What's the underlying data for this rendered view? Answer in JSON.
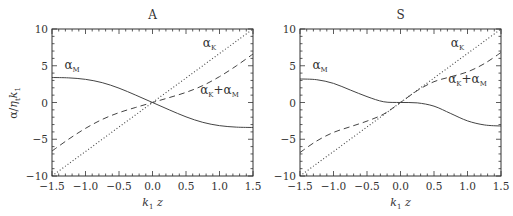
{
  "figure": {
    "ylabel": "α / η_t k_1",
    "xlabel": "k_1 z"
  },
  "chart_data": [
    {
      "type": "line",
      "title": "A",
      "xlabel": "k₁ z",
      "ylabel": "α/η_t k₁",
      "xlim": [
        -1.5,
        1.5
      ],
      "ylim": [
        -10,
        10
      ],
      "xticks": [
        -1.5,
        -1.0,
        -0.5,
        0.0,
        0.5,
        1.0,
        1.5
      ],
      "xtick_labels": [
        "−1.5",
        "−1.0",
        "−0.5",
        "0.0",
        "0.5",
        "1.0",
        "1.5"
      ],
      "yticks": [
        -10,
        -5,
        0,
        5,
        10
      ],
      "ytick_labels": [
        "−10",
        "−5",
        "0",
        "5",
        "10"
      ],
      "grid": false,
      "x": [
        -1.5,
        -1.25,
        -1.0,
        -0.75,
        -0.5,
        -0.25,
        0.0,
        0.25,
        0.5,
        0.75,
        1.0,
        1.25,
        1.5
      ],
      "series": [
        {
          "name": "α_K",
          "style": "dotted",
          "values": [
            -10.0,
            -8.33,
            -6.67,
            -5.0,
            -3.33,
            -1.67,
            0.0,
            1.67,
            3.33,
            5.0,
            6.67,
            8.33,
            10.0
          ]
        },
        {
          "name": "α_M",
          "style": "solid",
          "values": [
            3.4,
            3.35,
            3.15,
            2.7,
            1.95,
            1.0,
            0.0,
            -1.0,
            -1.95,
            -2.7,
            -3.15,
            -3.35,
            -3.4
          ]
        },
        {
          "name": "α_K+α_M",
          "style": "dashed",
          "values": [
            -6.6,
            -4.98,
            -3.52,
            -2.3,
            -1.38,
            -0.67,
            0.0,
            0.67,
            1.38,
            2.3,
            3.52,
            4.98,
            6.6
          ]
        }
      ],
      "annotations": [
        {
          "text": "α_K",
          "x": 0.85,
          "y": 7.6
        },
        {
          "text": "α_M",
          "x": -1.2,
          "y": 4.6
        },
        {
          "text": "α_K+α_M",
          "x": 1.0,
          "y": 1.2
        }
      ]
    },
    {
      "type": "line",
      "title": "S",
      "xlabel": "k₁ z",
      "ylabel": "",
      "xlim": [
        -1.5,
        1.5
      ],
      "ylim": [
        -10,
        10
      ],
      "xticks": [
        -1.5,
        -1.0,
        -0.5,
        0.0,
        0.5,
        1.0,
        1.5
      ],
      "xtick_labels": [
        "−1.5",
        "−1.0",
        "−0.5",
        "0.0",
        "0.5",
        "1.0",
        "1.5"
      ],
      "yticks": [
        -10,
        -5,
        0,
        5,
        10
      ],
      "ytick_labels": [
        "−10",
        "−5",
        "0",
        "5",
        "10"
      ],
      "grid": false,
      "x": [
        -1.5,
        -1.25,
        -1.0,
        -0.75,
        -0.5,
        -0.25,
        0.0,
        0.25,
        0.5,
        0.75,
        1.0,
        1.25,
        1.5
      ],
      "series": [
        {
          "name": "α_K",
          "style": "dotted",
          "values": [
            -10.0,
            -8.33,
            -6.67,
            -5.0,
            -3.33,
            -1.67,
            0.0,
            1.67,
            3.33,
            5.0,
            6.67,
            8.33,
            10.0
          ]
        },
        {
          "name": "α_M",
          "style": "solid",
          "values": [
            3.2,
            3.1,
            2.6,
            1.7,
            0.8,
            0.1,
            0.0,
            -0.05,
            -0.5,
            -1.5,
            -2.5,
            -3.05,
            -3.2
          ]
        },
        {
          "name": "α_K+α_M",
          "style": "dashed",
          "values": [
            -6.8,
            -5.23,
            -4.07,
            -3.3,
            -2.53,
            -1.57,
            0.0,
            1.62,
            2.83,
            3.5,
            4.17,
            5.28,
            6.8
          ]
        }
      ],
      "annotations": [
        {
          "text": "α_K",
          "x": 0.85,
          "y": 7.6
        },
        {
          "text": "α_M",
          "x": -1.2,
          "y": 4.6
        },
        {
          "text": "α_K+α_M",
          "x": 1.0,
          "y": 2.7
        }
      ]
    }
  ]
}
